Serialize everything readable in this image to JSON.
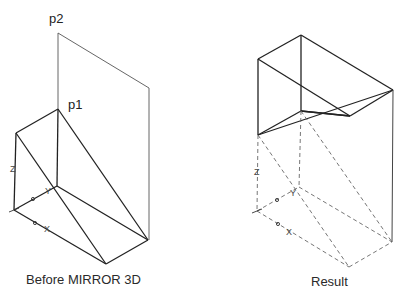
{
  "figures": [
    {
      "id": "before",
      "caption": "Before MIRROR 3D",
      "points": {
        "p1": "p1",
        "p2": "p2"
      },
      "axes": {
        "x": "X",
        "y": "Y",
        "z": "Z"
      }
    },
    {
      "id": "result",
      "caption": "Result",
      "axes": {
        "x": "X",
        "y": "Y",
        "z": "Z"
      }
    }
  ],
  "colors": {
    "solid_line": "#222222",
    "plane_line": "#555555",
    "dashed_line": "#666666",
    "background": "#ffffff"
  }
}
